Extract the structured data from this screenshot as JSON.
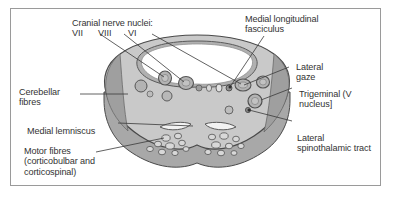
{
  "figure": {
    "frame_color": "#9a9a9a",
    "background": "#ffffff",
    "text_color": "#333333"
  },
  "anatomy": {
    "body_fill": "#c9c9c9",
    "body_stroke": "#4a4a4a",
    "side_face_fill": "#a8a8a8",
    "wedge_fill": "#9f9f9f",
    "ventricle_fill": "#ffffff",
    "ventricle_rim": "#b0b0b0",
    "nucleus_fill": "#b3b3b3",
    "nucleus_stroke": "#555555",
    "lemniscus_fill": "#f2f2f2",
    "tract_fill": "#d8d8d8",
    "leader_color": "#3a3a3a"
  },
  "labels": {
    "cranial_nerve_nuclei": {
      "title": "Cranial nerve nuclei:",
      "romans": [
        "VII",
        "VIII",
        "VI"
      ]
    },
    "medial_longitudinal_fasciculus": "Medial longitudinal\nfasciculus",
    "lateral_gaze": "Lateral\ngaze",
    "trigeminal": "Trigeminal (V\nnucleus]",
    "lateral_spinothalamic_tract": "Lateral\nspinothalamic tract",
    "cerebellar_fibres": "Cerebellar\nfibres",
    "medial_lemniscus": "Medial lemniscus",
    "motor_fibres": "Motor fibres\n(corticobulbar and\ncorticospinal)"
  }
}
